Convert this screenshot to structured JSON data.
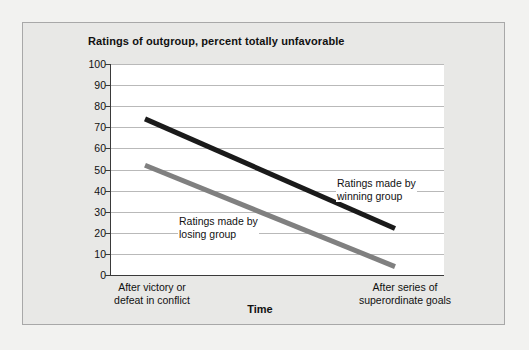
{
  "chart_data": {
    "type": "line",
    "title": "Ratings of outgroup, percent totally unfavorable",
    "xlabel": "Time",
    "ylabel": "",
    "ylim": [
      0,
      100
    ],
    "yticks": [
      100,
      90,
      80,
      70,
      60,
      50,
      40,
      30,
      20,
      10,
      0
    ],
    "grid": true,
    "legend_position": "inline-annotations",
    "categories": [
      "After victory or\ndefeat in conflict",
      "After series of\nsuperordinate goals"
    ],
    "series": [
      {
        "name": "Ratings made by\nwinning group",
        "color": "#1a1a1a",
        "values": [
          74,
          22
        ]
      },
      {
        "name": "Ratings made by\nlosing group",
        "color": "#808080",
        "values": [
          52,
          4
        ]
      }
    ],
    "annotations": [
      "Ratings made by\nwinning group",
      "Ratings made by\nlosing group"
    ]
  },
  "colors": {
    "page_background": "#f2f2f0",
    "frame_background": "#e8e8e6",
    "frame_border": "#a8a8a8",
    "plot_background": "#ffffff",
    "gridline": "#b9b9b9",
    "axis": "#3a3a3a",
    "text": "#111111",
    "winning_series": "#1a1a1a",
    "losing_series": "#808080"
  }
}
